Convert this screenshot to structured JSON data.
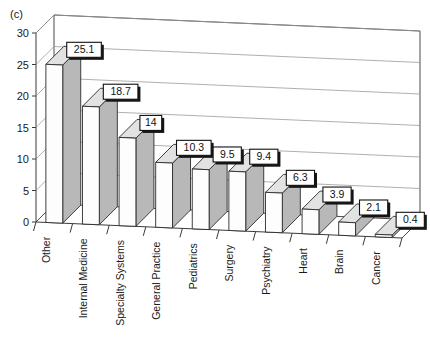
{
  "panel": {
    "tag": "(c)"
  },
  "chart_data": {
    "type": "bar",
    "title": "",
    "subtitle": "",
    "xlabel": "",
    "ylabel": "",
    "ylim": [
      0,
      30
    ],
    "ytick_step": 5,
    "yticks": [
      "0",
      "5",
      "10",
      "15",
      "20",
      "25",
      "30"
    ],
    "grid": true,
    "legend": null,
    "three_d": true,
    "categories": [
      "Other",
      "Internal Medicine",
      "Specialty Systems",
      "General Practice",
      "Pediatrics",
      "Surgery",
      "Psychiatry",
      "Heart",
      "Brain",
      "Cancer"
    ],
    "values": [
      25.1,
      18.7,
      14,
      10.3,
      9.5,
      9.4,
      6.3,
      3.9,
      2.1,
      0.4
    ],
    "data_labels": [
      "25.1",
      "18.7",
      "14",
      "10.3",
      "9.5",
      "9.4",
      "6.3",
      "3.9",
      "2.1",
      "0.4"
    ],
    "colors": {
      "bar_front": "#fdfdfd",
      "bar_side": "#b8b8b8",
      "bar_top": "#e2e2e2",
      "grid": "#9a9a9a",
      "axis": "#3a3a3a",
      "label_box": "#ffffff",
      "label_shadow": "#151515",
      "background": "#ffffff"
    }
  }
}
